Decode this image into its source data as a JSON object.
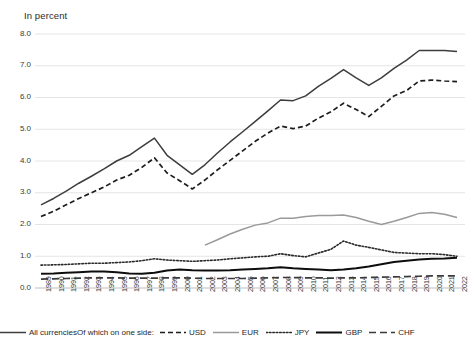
{
  "chart_data": {
    "type": "line",
    "title": "",
    "ylabel": "In percent",
    "xlabel": "",
    "ylim": [
      0.0,
      8.0
    ],
    "ytick_labels": [
      "0.0",
      "1.0",
      "2.0",
      "3.0",
      "4.0",
      "5.0",
      "6.0",
      "7.0",
      "8.0"
    ],
    "ytick_values": [
      0.0,
      1.0,
      2.0,
      3.0,
      4.0,
      5.0,
      6.0,
      7.0,
      8.0
    ],
    "grid": "horizontal",
    "legend_position": "bottom",
    "legend_prefix": "Of which on one side:",
    "categories": [
      1989,
      1990,
      1991,
      1992,
      1993,
      1994,
      1995,
      1996,
      1997,
      1998,
      1999,
      2000,
      2001,
      2002,
      2003,
      2004,
      2005,
      2006,
      2007,
      2008,
      2009,
      2010,
      2011,
      2012,
      2013,
      2014,
      2015,
      2016,
      2017,
      2018,
      2019,
      2020,
      2021,
      2022
    ],
    "x": [
      "1989",
      "1990",
      "1991",
      "1992",
      "1993",
      "1994",
      "1995",
      "1996",
      "1997",
      "1998",
      "1999",
      "2000",
      "2001",
      "2002",
      "2003",
      "2004",
      "2005",
      "2006",
      "2007",
      "2008",
      "2009",
      "2010",
      "2011",
      "2012",
      "2013",
      "2014",
      "2015",
      "2016",
      "2017",
      "2018",
      "2019",
      "2020",
      "2021",
      "2022"
    ],
    "series": [
      {
        "name": "All currencies",
        "style": "solid",
        "color": "#3d3d3d",
        "width": 1.5,
        "values": [
          2.62,
          2.82,
          3.05,
          3.3,
          3.52,
          3.75,
          4.0,
          4.18,
          4.45,
          4.72,
          4.18,
          3.88,
          3.58,
          3.88,
          4.25,
          4.6,
          4.92,
          5.25,
          5.58,
          5.92,
          5.9,
          6.05,
          6.35,
          6.6,
          6.88,
          6.62,
          6.38,
          6.62,
          6.92,
          7.18,
          7.48,
          7.48,
          7.48,
          7.45
        ]
      },
      {
        "name": "USD",
        "style": "dashed",
        "color": "#1d1d1d",
        "width": 1.7,
        "values": [
          2.25,
          2.42,
          2.62,
          2.82,
          3.0,
          3.18,
          3.4,
          3.55,
          3.8,
          4.1,
          3.62,
          3.38,
          3.12,
          3.4,
          3.72,
          4.02,
          4.32,
          4.62,
          4.88,
          5.1,
          5.02,
          5.1,
          5.35,
          5.55,
          5.82,
          5.62,
          5.4,
          5.72,
          6.05,
          6.22,
          6.52,
          6.55,
          6.52,
          6.5
        ]
      },
      {
        "name": "EUR",
        "style": "solid",
        "color": "#9a9a9a",
        "width": 1.5,
        "start_year": 2002,
        "values": [
          null,
          null,
          null,
          null,
          null,
          null,
          null,
          null,
          null,
          null,
          null,
          null,
          null,
          1.35,
          1.52,
          1.7,
          1.85,
          1.98,
          2.05,
          2.2,
          2.2,
          2.25,
          2.28,
          2.28,
          2.3,
          2.22,
          2.1,
          2.0,
          2.1,
          2.22,
          2.35,
          2.38,
          2.32,
          2.22
        ]
      },
      {
        "name": "JPY",
        "style": "dotted",
        "color": "#2b2b2b",
        "width": 1.6,
        "values": [
          0.72,
          0.73,
          0.74,
          0.76,
          0.78,
          0.78,
          0.8,
          0.82,
          0.86,
          0.92,
          0.88,
          0.86,
          0.84,
          0.86,
          0.88,
          0.92,
          0.95,
          0.98,
          1.0,
          1.08,
          1.02,
          0.98,
          1.1,
          1.22,
          1.48,
          1.35,
          1.28,
          1.2,
          1.12,
          1.1,
          1.08,
          1.08,
          1.05,
          1.0
        ]
      },
      {
        "name": "GBP",
        "style": "solid",
        "color": "#0d0d0d",
        "width": 2.0,
        "values": [
          0.45,
          0.46,
          0.48,
          0.5,
          0.52,
          0.52,
          0.5,
          0.46,
          0.45,
          0.48,
          0.55,
          0.58,
          0.56,
          0.55,
          0.55,
          0.56,
          0.58,
          0.6,
          0.62,
          0.65,
          0.62,
          0.6,
          0.58,
          0.56,
          0.58,
          0.62,
          0.68,
          0.75,
          0.82,
          0.86,
          0.9,
          0.92,
          0.93,
          0.95
        ]
      },
      {
        "name": "CHF",
        "style": "longdash",
        "color": "#3a3a3a",
        "width": 1.7,
        "values": [
          0.28,
          0.29,
          0.3,
          0.31,
          0.32,
          0.32,
          0.32,
          0.31,
          0.31,
          0.31,
          0.32,
          0.32,
          0.31,
          0.3,
          0.3,
          0.3,
          0.3,
          0.31,
          0.32,
          0.33,
          0.33,
          0.32,
          0.32,
          0.31,
          0.32,
          0.32,
          0.33,
          0.34,
          0.35,
          0.36,
          0.37,
          0.38,
          0.38,
          0.38
        ]
      }
    ]
  },
  "legend": {
    "prefix": "Of which on one side:",
    "items": [
      {
        "label": "All currencies"
      },
      {
        "label": "USD"
      },
      {
        "label": "EUR"
      },
      {
        "label": "JPY"
      },
      {
        "label": "GBP"
      },
      {
        "label": "CHF"
      }
    ]
  }
}
